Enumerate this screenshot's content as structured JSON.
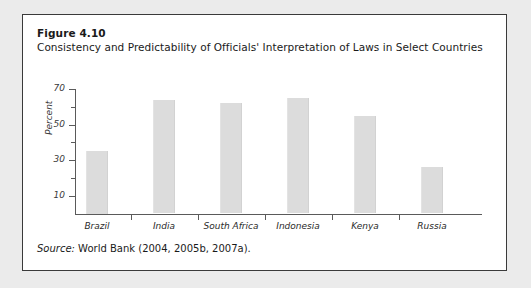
{
  "figure": {
    "number": "Figure 4.10",
    "title": "Consistency and Predictability of Officials' Interpretation of Laws in Select Countries",
    "source_prefix": "Source:",
    "source_text": " World Bank (2004, 2005b, 2007a)."
  },
  "chart_data": {
    "type": "bar",
    "title": "Consistency and Predictability of Officials' Interpretation of Laws in Select Countries",
    "categories": [
      "Brazil",
      "India",
      "South Africa",
      "Indonesia",
      "Kenya",
      "Russia"
    ],
    "values": [
      35,
      64,
      62,
      65,
      55,
      26
    ],
    "xlabel": "",
    "ylabel": "Percent",
    "ylim": [
      0,
      70
    ],
    "yticks": [
      10,
      30,
      50,
      70
    ],
    "yticks_minor": [
      20,
      40,
      60
    ],
    "grid": false,
    "legend": null,
    "bar_color": "#dcdcdc",
    "axis_color": "#5a5a5a"
  }
}
